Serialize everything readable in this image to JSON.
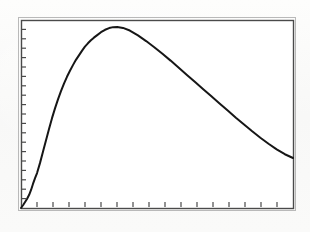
{
  "figure": {
    "background_color": "#fbfbfa",
    "ink_color": "#161616",
    "frame_color": "#4a4a4a",
    "title": "",
    "caption": ""
  },
  "axes": {
    "frame": {
      "left": 21,
      "top": 20,
      "right": 293,
      "bottom": 208
    },
    "x_axis": {
      "label": "",
      "tick_count": 17,
      "tick_length": 5,
      "tick_labels": [],
      "minor_ticks": true
    },
    "y_axis": {
      "label": "",
      "tick_count": 20,
      "tick_length": 4,
      "tick_labels": [],
      "minor_ticks": true
    },
    "grid": "off",
    "legend": "none"
  },
  "chart_data": {
    "type": "line",
    "title": "",
    "subtitle": "",
    "xlabel": "",
    "ylabel": "",
    "xlim": [
      0,
      1
    ],
    "ylim": [
      0,
      1
    ],
    "grid": false,
    "legend_position": "none",
    "annotations": [],
    "tick_labels_x": [],
    "tick_labels_y": [],
    "series": [
      {
        "name": "distribution curve",
        "style": "solid",
        "color": "#161616",
        "line_width": 2,
        "x": [
          0.0,
          0.008,
          0.015,
          0.022,
          0.03,
          0.037,
          0.044,
          0.052,
          0.059,
          0.07,
          0.081,
          0.092,
          0.103,
          0.114,
          0.125,
          0.136,
          0.147,
          0.158,
          0.169,
          0.18,
          0.191,
          0.202,
          0.213,
          0.224,
          0.235,
          0.246,
          0.257,
          0.268,
          0.279,
          0.294,
          0.309,
          0.324,
          0.339,
          0.354,
          0.375,
          0.4,
          0.43,
          0.46,
          0.49,
          0.52,
          0.55,
          0.58,
          0.61,
          0.64,
          0.67,
          0.7,
          0.73,
          0.76,
          0.79,
          0.82,
          0.85,
          0.88,
          0.91,
          0.94,
          0.97,
          1.0
        ],
        "y": [
          0.0,
          0.016,
          0.032,
          0.048,
          0.07,
          0.096,
          0.128,
          0.16,
          0.186,
          0.24,
          0.3,
          0.36,
          0.42,
          0.478,
          0.53,
          0.578,
          0.622,
          0.662,
          0.698,
          0.73,
          0.76,
          0.788,
          0.812,
          0.836,
          0.858,
          0.876,
          0.892,
          0.906,
          0.918,
          0.935,
          0.948,
          0.957,
          0.962,
          0.963,
          0.958,
          0.944,
          0.918,
          0.888,
          0.855,
          0.82,
          0.784,
          0.746,
          0.708,
          0.67,
          0.632,
          0.594,
          0.556,
          0.518,
          0.48,
          0.444,
          0.408,
          0.374,
          0.342,
          0.312,
          0.286,
          0.266
        ]
      }
    ]
  }
}
